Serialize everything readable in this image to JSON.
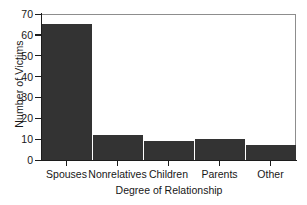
{
  "chart_data": {
    "type": "bar",
    "title": "",
    "xlabel": "Degree of Relationship",
    "ylabel": "Number of Victims",
    "categories": [
      "Spouses",
      "Nonrelatives",
      "Children",
      "Parents",
      "Other"
    ],
    "values": [
      65,
      12,
      9,
      10,
      7
    ],
    "ylim": [
      0,
      70
    ],
    "ytick_values": [
      0,
      10,
      20,
      30,
      40,
      50,
      60,
      70
    ],
    "ytick_labels": [
      "0",
      "10",
      "20",
      "30",
      "40",
      "50",
      "60",
      "70"
    ],
    "grid": false,
    "legend": null,
    "bar_color": "#333333",
    "axis_color": "#1c1c1c",
    "frame_color": "#8d8d8d",
    "background_color": "#ffffff"
  }
}
